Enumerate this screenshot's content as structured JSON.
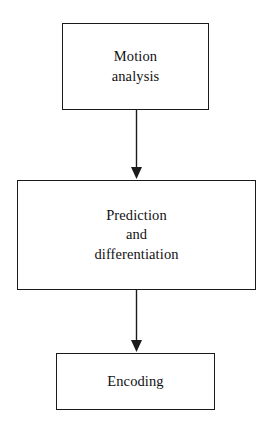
{
  "diagram": {
    "type": "flowchart",
    "orientation": "vertical",
    "background_color": "#ffffff",
    "stroke_color": "#1a1a1a",
    "text_color": "#111111",
    "nodes": [
      {
        "id": "motion-analysis",
        "shape": "rectangle",
        "lines": [
          "Motion",
          "analysis"
        ],
        "line1": "Motion",
        "line2": "analysis"
      },
      {
        "id": "prediction-differentiation",
        "shape": "rectangle",
        "lines": [
          "Prediction",
          "and",
          "differentiation"
        ],
        "line1": "Prediction",
        "line2": "and",
        "line3": "differentiation"
      },
      {
        "id": "encoding",
        "shape": "rectangle",
        "lines": [
          "Encoding"
        ],
        "line1": "Encoding"
      }
    ],
    "connectors": [
      {
        "id": "motion-analysis-to-prediction",
        "from": "motion-analysis",
        "to": "prediction-differentiation",
        "style": "solid-line-filled-arrowhead",
        "direction": "down"
      },
      {
        "id": "prediction-to-encoding",
        "from": "prediction-differentiation",
        "to": "encoding",
        "style": "solid-line-filled-arrowhead",
        "direction": "down"
      }
    ]
  }
}
